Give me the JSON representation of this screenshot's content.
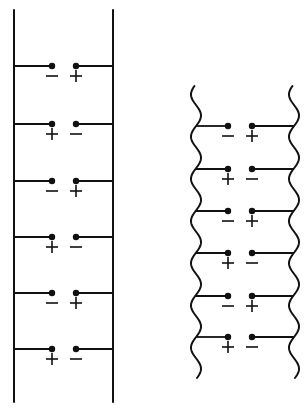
{
  "diagram": {
    "type": "schematic",
    "colors": {
      "ink": "#111111",
      "background": "#ffffff"
    },
    "figures": [
      {
        "id": "straight-ladder",
        "rail_style": "straight",
        "rungs": [
          {
            "left_sign": "−",
            "right_sign": "+"
          },
          {
            "left_sign": "+",
            "right_sign": "−"
          },
          {
            "left_sign": "−",
            "right_sign": "+"
          },
          {
            "left_sign": "+",
            "right_sign": "−"
          },
          {
            "left_sign": "−",
            "right_sign": "+"
          },
          {
            "left_sign": "+",
            "right_sign": "−"
          }
        ]
      },
      {
        "id": "wavy-ladder",
        "rail_style": "wavy",
        "rungs": [
          {
            "left_sign": "−",
            "right_sign": "+"
          },
          {
            "left_sign": "+",
            "right_sign": "−"
          },
          {
            "left_sign": "−",
            "right_sign": "+"
          },
          {
            "left_sign": "+",
            "right_sign": "−"
          },
          {
            "left_sign": "−",
            "right_sign": "+"
          },
          {
            "left_sign": "+",
            "right_sign": "−"
          }
        ]
      }
    ]
  }
}
